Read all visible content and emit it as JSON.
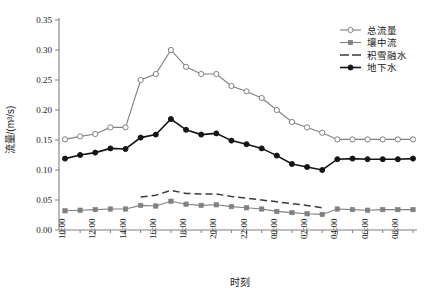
{
  "chart_data": {
    "type": "line",
    "title": "",
    "xlabel": "时刻",
    "ylabel": "流量/(m³/s)",
    "ylim": [
      0.0,
      0.35
    ],
    "ytick_labels": [
      "0.00",
      "0.05",
      "0.10",
      "0.15",
      "0.20",
      "0.25",
      "0.30",
      "0.35"
    ],
    "ytick_values": [
      0.0,
      0.05,
      0.1,
      0.15,
      0.2,
      0.25,
      0.3,
      0.35
    ],
    "grid": false,
    "legend_position": "top-right",
    "x": [
      "10:00",
      "11:00",
      "12:00",
      "13:00",
      "14:00",
      "15:00",
      "16:00",
      "17:00",
      "18:00",
      "19:00",
      "20:00",
      "21:00",
      "22:00",
      "23:00",
      "00:00",
      "01:00",
      "02:00",
      "03:00",
      "04:00",
      "05:00",
      "06:00",
      "07:00",
      "08:00",
      "09:00"
    ],
    "xtick_labels": [
      "10:00",
      "12:00",
      "14:00",
      "16:00",
      "18:00",
      "20:00",
      "22:00",
      "00:00",
      "02:00",
      "04:00",
      "06:00",
      "08:00"
    ],
    "series": [
      {
        "name": "总流量",
        "marker": "open-circle",
        "line": "solid",
        "color": "#808080",
        "values": [
          0.151,
          0.156,
          0.16,
          0.171,
          0.171,
          0.25,
          0.26,
          0.3,
          0.272,
          0.26,
          0.26,
          0.24,
          0.231,
          0.22,
          0.2,
          0.18,
          0.171,
          0.162,
          0.151,
          0.151,
          0.151,
          0.151,
          0.151,
          0.151
        ]
      },
      {
        "name": "壤中流",
        "marker": "filled-square",
        "line": "solid",
        "color": "#808080",
        "values": [
          0.032,
          0.033,
          0.034,
          0.035,
          0.035,
          0.041,
          0.04,
          0.048,
          0.043,
          0.041,
          0.042,
          0.039,
          0.037,
          0.035,
          0.031,
          0.029,
          0.027,
          0.026,
          0.035,
          0.034,
          0.033,
          0.034,
          0.034,
          0.034
        ]
      },
      {
        "name": "积雪融水",
        "marker": "none",
        "line": "dashed",
        "color": "#3a3a3a",
        "values": [
          null,
          null,
          null,
          null,
          null,
          0.055,
          0.058,
          0.066,
          0.061,
          0.06,
          0.06,
          0.056,
          0.053,
          0.05,
          0.047,
          0.044,
          0.041,
          0.037,
          null,
          null,
          null,
          null,
          null,
          null
        ]
      },
      {
        "name": "地下水",
        "marker": "filled-circle",
        "line": "solid",
        "color": "#141414",
        "values": [
          0.119,
          0.125,
          0.129,
          0.136,
          0.135,
          0.154,
          0.159,
          0.185,
          0.167,
          0.159,
          0.161,
          0.149,
          0.143,
          0.136,
          0.124,
          0.11,
          0.105,
          0.1,
          0.118,
          0.119,
          0.118,
          0.118,
          0.118,
          0.119
        ]
      }
    ]
  },
  "legend": {
    "items": [
      {
        "label": "总流量"
      },
      {
        "label": "壤中流"
      },
      {
        "label": "积雪融水"
      },
      {
        "label": "地下水"
      }
    ]
  },
  "axes": {
    "y_title": "流量/(m³/s)",
    "x_title": "时刻"
  }
}
